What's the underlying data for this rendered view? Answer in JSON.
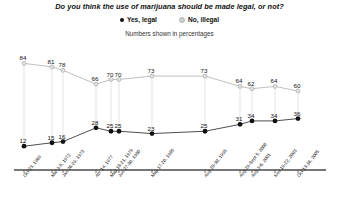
{
  "chart_data": {
    "type": "line",
    "title": "Do you think the use of marijuana should be made legal, or not?",
    "subtitle": "Numbers shown in percentages",
    "xlabel": "",
    "ylabel": "",
    "ylim": [
      0,
      100
    ],
    "grid": false,
    "legend_position": "top-center",
    "categories": [
      "Oct 23, 1969",
      "Mar 3-5, 1972",
      "Jan 26-29, 1973",
      "Apr 14, 1977",
      "May 18-21, 1979",
      "Jun 27-30, 1980",
      "May 17-20, 1985",
      "Aug 28-30, 1995",
      "Aug 29-Sept 5, 2000",
      "Aug 3-6, 2001",
      "Nov 19-22, 2003",
      "Oct 13-16, 2005"
    ],
    "series": [
      {
        "name": "Yes, legal",
        "color": "#111111",
        "marker": "filled-circle",
        "values": [
          12,
          15,
          16,
          28,
          25,
          25,
          23,
          25,
          31,
          34,
          34,
          36
        ]
      },
      {
        "name": "No, illegal",
        "color": "#c8c8c8",
        "marker": "open-circle",
        "values": [
          84,
          81,
          78,
          66,
          70,
          70,
          73,
          73,
          64,
          62,
          64,
          60
        ]
      }
    ]
  },
  "legend": {
    "yes_label": "Yes, legal",
    "no_label": "No, illegal"
  }
}
